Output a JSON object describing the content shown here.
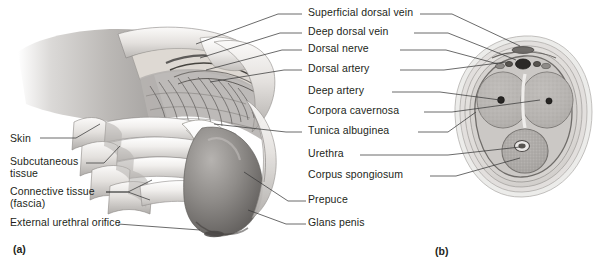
{
  "figure": {
    "panels": [
      {
        "letter": "(a)",
        "x": 13,
        "y": 243
      },
      {
        "letter": "(b)",
        "x": 435,
        "y": 245
      }
    ]
  },
  "labels_left": [
    {
      "text": "Skin",
      "x": 10,
      "y": 137
    },
    {
      "text": "Subcutaneous",
      "x": 10,
      "y": 160
    },
    {
      "text": "tissue",
      "x": 10,
      "y": 172
    },
    {
      "text": "Connective tissue",
      "x": 10,
      "y": 190
    },
    {
      "text": "(fascia)",
      "x": 10,
      "y": 202
    },
    {
      "text": "External urethral orifice",
      "x": 10,
      "y": 221
    }
  ],
  "labels_right": [
    {
      "text": "Superficial dorsal vein",
      "x": 308,
      "y": 11
    },
    {
      "text": "Deep dorsal vein",
      "x": 308,
      "y": 30
    },
    {
      "text": "Dorsal nerve",
      "x": 308,
      "y": 47
    },
    {
      "text": "Dorsal artery",
      "x": 308,
      "y": 67
    },
    {
      "text": "Deep artery",
      "x": 308,
      "y": 89
    },
    {
      "text": "Corpora cavernosa",
      "x": 308,
      "y": 109
    },
    {
      "text": "Tunica albuginea",
      "x": 308,
      "y": 129
    },
    {
      "text": "Urethra",
      "x": 308,
      "y": 152
    },
    {
      "text": "Corpus spongiosum",
      "x": 308,
      "y": 173
    },
    {
      "text": "Prepuce",
      "x": 308,
      "y": 198
    },
    {
      "text": "Glans penis",
      "x": 308,
      "y": 221
    }
  ],
  "colors": {
    "background": "#ffffff",
    "text": "#231f20",
    "leader_line": "#3a3a3a",
    "tissue_light": "#e8e6e4",
    "tissue_mid": "#c3c0bd",
    "tissue_dark": "#8d8a87",
    "glans": "#7c7a78",
    "cavernosa_fill": "#b9b7b5",
    "vessel_dark": "#2b2b2b"
  }
}
